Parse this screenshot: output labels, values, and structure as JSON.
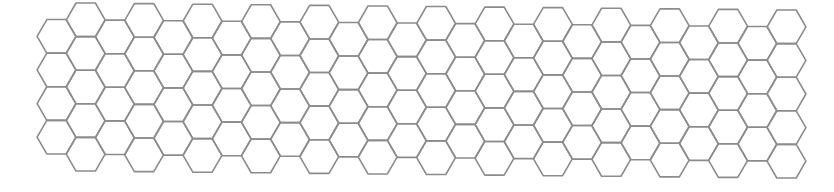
{
  "canvas": {
    "width": 834,
    "height": 192,
    "background": "#ffffff"
  },
  "hex_grid": {
    "orientation": "flat-top",
    "columns": 26,
    "rows_in_even_columns": 4,
    "rows_in_odd_columns": 5,
    "even_column_offset": "down",
    "radius": 19.4,
    "column_spacing": 29.2,
    "first_column_center_x": 56.5,
    "odd_column_top_y_at_x84": 3.0,
    "vertical_drift_per_px": 0.00996,
    "stroke_color": "#8c8c8c",
    "stroke_width": 1.6,
    "fill": "none"
  }
}
